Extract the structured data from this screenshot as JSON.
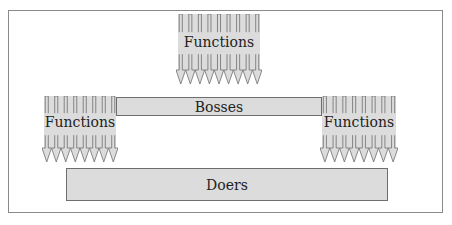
{
  "diagram": {
    "top_arrows": {
      "label": "Functions",
      "count": 9
    },
    "left_arrows": {
      "label": "Functions",
      "count": 8
    },
    "right_arrows": {
      "label": "Functions",
      "count": 9
    },
    "bosses": {
      "label": "Bosses"
    },
    "doers": {
      "label": "Doers"
    }
  },
  "colors": {
    "fill": "#dcdcdc",
    "stroke": "#6e6e6e",
    "frame": "#8a8a8a"
  }
}
